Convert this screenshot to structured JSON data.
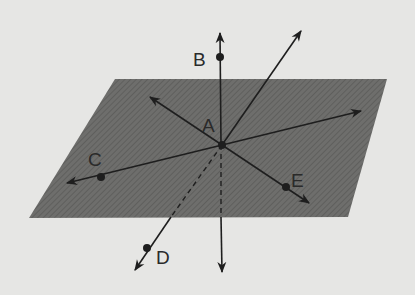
{
  "figure": {
    "colors": {
      "background": "#e6e6e4",
      "plane": "#6e6e6c",
      "line": "#1e1e1e"
    },
    "plane": {
      "points": [
        [
          115,
          79
        ],
        [
          387,
          79
        ],
        [
          348,
          217
        ],
        [
          29,
          218
        ]
      ]
    },
    "points": [
      {
        "label": "A",
        "x": 222,
        "y": 145,
        "label_x": 202,
        "label_y": 132
      },
      {
        "label": "B",
        "x": 220,
        "y": 57,
        "label_x": 193,
        "label_y": 66
      },
      {
        "label": "C",
        "x": 101,
        "y": 177,
        "label_x": 88,
        "label_y": 166
      },
      {
        "label": "D",
        "x": 147,
        "y": 248,
        "label_x": 156,
        "label_y": 264
      },
      {
        "label": "E",
        "x": 286,
        "y": 187,
        "label_x": 291,
        "label_y": 187
      }
    ]
  }
}
